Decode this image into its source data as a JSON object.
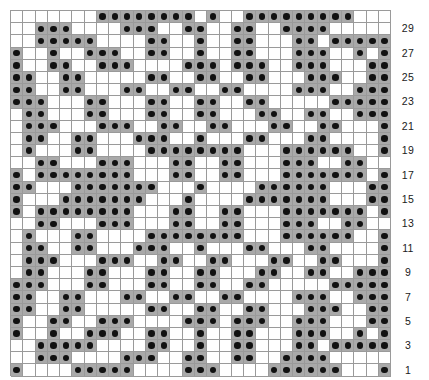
{
  "chart_data": {
    "type": "heatmap",
    "title": "",
    "xlabel": "",
    "ylabel": "",
    "columns": 31,
    "rows": 30,
    "legend": [
      {
        "key": "1",
        "label": "filled-stitch",
        "color": "#a9a9a9",
        "marker": "black-dot"
      },
      {
        "key": "0",
        "label": "empty-stitch",
        "color": "#ffffff",
        "marker": "none"
      }
    ],
    "row_number_side": "right",
    "row_numbers_shown": [
      1,
      3,
      5,
      7,
      9,
      11,
      13,
      15,
      17,
      19,
      21,
      23,
      25,
      27,
      29
    ],
    "grid": [
      "0000000111111110100111111111000",
      "0011100001110011001100111100000",
      "0011111000011001001100011011111",
      "1001001110011001001100011100101",
      "1001100111000011101110011100011",
      "1100110000011001100110001110011",
      "1100110001100110011000011100111",
      "1110001100011001100110000011111",
      "0110001100011001100011001100111",
      "0111000111001100110001100110001",
      "0110011000111001000110001100001",
      "0100011000011111111000111111001",
      "0011000111000110011000111001100",
      "1011111111000110011000111111101",
      "1100011111110001000011111100011",
      "1000111111100010000111111100011",
      "1011111111000110011000111111101",
      "0011000111000110011000111001100",
      "0100011000011111111000111111001",
      "0110011000111001000110001100001",
      "0111000111001100110001100110001",
      "0110001100011001100011001100111",
      "1110001100011001100110000011111",
      "1100110001100110011000011100111",
      "1100110000011001100110001110011",
      "1001100111000011101110011100011",
      "1001001110011001001100011100101",
      "0011111000011001001100011011111",
      "0011100001110011001100111100000",
      "1000011111000011100001111110001"
    ]
  },
  "page": {
    "watermark": ""
  }
}
